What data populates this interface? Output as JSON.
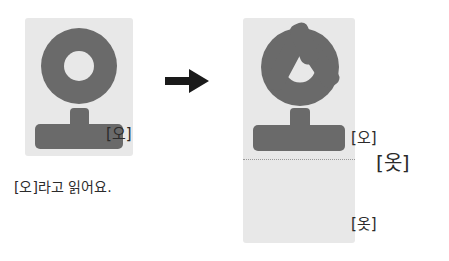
{
  "meta": {
    "background_color": "#ffffff",
    "card_color": "#e8e8e8",
    "stroke_color": "#6a6a6a",
    "text_color": "#2b2b2b",
    "arrow_color": "#1a1a1a",
    "divider_color": "#9a9a9a"
  },
  "left_panel": {
    "syllable": "오",
    "components": {
      "consonant": "ㅇ",
      "vowel": "ㅗ"
    },
    "label": "[오]",
    "caption": "[오]라고 읽어요."
  },
  "arrow": {
    "icon": "arrow-right-icon",
    "direction": "right"
  },
  "right_panel": {
    "syllable": "옷",
    "components": {
      "consonant": "ㅇ",
      "vowel": "ㅗ",
      "final_consonant": "ㅅ"
    },
    "label_top": "[오]",
    "label_result": "[옷]",
    "label_bottom": "[옷]",
    "divider": "dotted"
  }
}
